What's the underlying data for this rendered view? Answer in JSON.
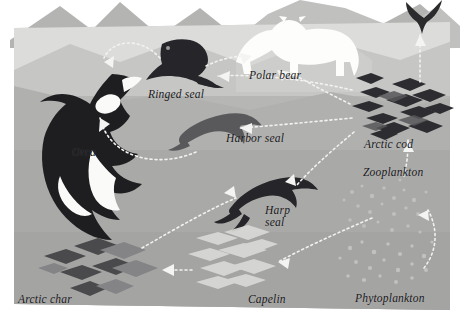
{
  "diagram": {
    "kind": "food-web",
    "background": {
      "paper": "#ffffff",
      "sky": "#d8d8d6",
      "mountains_far": "#b9b9b7",
      "mountains_near": "#a8a8a6",
      "ice_shelf": "#e9e9e7",
      "water_surface": "#cfcfce",
      "water_upper": "#bfbfbd",
      "water_mid": "#a9a9a7",
      "water_deep": "#9f9f9d",
      "silhouette_dark": "#2b2b2e",
      "silhouette_mid": "#5c5c5f",
      "silhouette_light": "#e7e7e5",
      "arrow": "#f4f4f2"
    },
    "labels": [
      {
        "id": "orca",
        "text": "Orca",
        "x": 72,
        "y": 146,
        "size": 11.5
      },
      {
        "id": "ringed-seal",
        "text": "Ringed seal",
        "x": 148,
        "y": 88,
        "size": 11.5
      },
      {
        "id": "polar-bear",
        "text": "Polar bear",
        "x": 249,
        "y": 69,
        "size": 11.5
      },
      {
        "id": "arctic-cod",
        "text": "Arctic cod",
        "x": 364,
        "y": 138,
        "size": 11.5
      },
      {
        "id": "harbor-seal",
        "text": "Harbor seal",
        "x": 226,
        "y": 132,
        "size": 11.5
      },
      {
        "id": "zooplankton",
        "text": "Zooplankton",
        "x": 363,
        "y": 166,
        "size": 11.5
      },
      {
        "id": "harp-seal",
        "text": "Harp\nseal",
        "x": 265,
        "y": 204,
        "size": 11.5
      },
      {
        "id": "arctic-char",
        "text": "Arctic char",
        "x": 18,
        "y": 293,
        "size": 11.5
      },
      {
        "id": "capelin",
        "text": "Capelin",
        "x": 248,
        "y": 293,
        "size": 11.5
      },
      {
        "id": "phytoplankton",
        "text": "Phytoplankton",
        "x": 355,
        "y": 292,
        "size": 11.5
      }
    ],
    "organisms": [
      {
        "id": "orca",
        "name": "Orca",
        "tone": "dark",
        "note": "breaching killer whale, left edge"
      },
      {
        "id": "ringed-seal",
        "name": "Ringed seal",
        "tone": "dark",
        "note": "seal on ice, upper middle"
      },
      {
        "id": "polar-bear",
        "name": "Polar bear",
        "tone": "white",
        "note": "walking bear on ice shelf, top"
      },
      {
        "id": "seabird",
        "name": "Seabird",
        "tone": "dark",
        "note": "bird in flight, top right"
      },
      {
        "id": "harbor-seal",
        "name": "Harbor seal",
        "tone": "mid",
        "note": "swimming seal, centre"
      },
      {
        "id": "harp-seal",
        "name": "Harp seal",
        "tone": "dark",
        "note": "swimming seal, lower centre"
      },
      {
        "id": "arctic-cod",
        "name": "Arctic cod",
        "tone": "dark",
        "note": "school of fish, right"
      },
      {
        "id": "arctic-char",
        "name": "Arctic char",
        "tone": "mid",
        "note": "school of fish, bottom left"
      },
      {
        "id": "capelin",
        "name": "Capelin",
        "tone": "light",
        "note": "school of fish, bottom centre"
      },
      {
        "id": "zooplankton",
        "name": "Zooplankton",
        "tone": "faint",
        "note": "speckled cloud, right"
      },
      {
        "id": "phytoplankton",
        "name": "Phytoplankton",
        "tone": "faint",
        "note": "speckled cloud, bottom right"
      }
    ],
    "links": [
      {
        "from": "ringed-seal",
        "to": "orca",
        "style": "dotted-curved"
      },
      {
        "from": "harbor-seal",
        "to": "orca",
        "style": "dotted-curved"
      },
      {
        "from": "ringed-seal",
        "to": "polar-bear",
        "style": "dotted"
      },
      {
        "from": "arctic-cod",
        "to": "ringed-seal",
        "style": "dotted"
      },
      {
        "from": "arctic-cod",
        "to": "polar-bear",
        "style": "dotted"
      },
      {
        "from": "arctic-cod",
        "to": "harbor-seal",
        "style": "dotted"
      },
      {
        "from": "arctic-cod",
        "to": "harp-seal",
        "style": "dotted"
      },
      {
        "from": "arctic-cod",
        "to": "seabird",
        "style": "dotted"
      },
      {
        "from": "zooplankton",
        "to": "arctic-cod",
        "style": "dotted"
      },
      {
        "from": "phytoplankton",
        "to": "zooplankton",
        "style": "dotted-curved"
      },
      {
        "from": "phytoplankton",
        "to": "capelin",
        "style": "dotted"
      },
      {
        "from": "capelin",
        "to": "arctic-char",
        "style": "dotted"
      },
      {
        "from": "arctic-char",
        "to": "harp-seal",
        "style": "dotted"
      }
    ]
  }
}
